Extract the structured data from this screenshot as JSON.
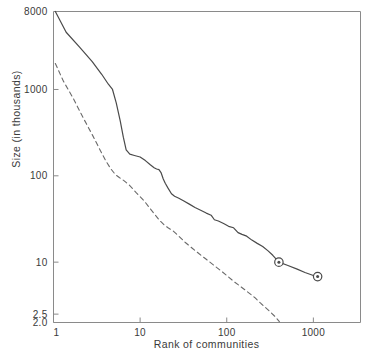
{
  "chart_data": {
    "type": "line",
    "title": "",
    "xlabel": "Rank of communities",
    "ylabel": "Size (in thousands)",
    "xscale": "log",
    "yscale": "log",
    "xlim": [
      1,
      3500
    ],
    "ylim": [
      2.0,
      8000
    ],
    "grid": false,
    "legend": "none",
    "xticks": [
      {
        "value": 1,
        "label": "1"
      },
      {
        "value": 10,
        "label": "10"
      },
      {
        "value": 100,
        "label": "100"
      },
      {
        "value": 1000,
        "label": "1000"
      }
    ],
    "yticks": [
      {
        "value": 8000,
        "label": "8000"
      },
      {
        "value": 1000,
        "label": "1000"
      },
      {
        "value": 100,
        "label": "100"
      },
      {
        "value": 10,
        "label": "10"
      },
      {
        "value": 2.5,
        "label": "2.5"
      },
      {
        "value": 2.0,
        "label": "2.0"
      }
    ],
    "series": [
      {
        "name": "upper-solid-curve",
        "style": "solid",
        "color": "#4a4a4a",
        "points": [
          [
            1.05,
            8000
          ],
          [
            1.4,
            4600
          ],
          [
            2.0,
            3100
          ],
          [
            2.8,
            2100
          ],
          [
            3.6,
            1500
          ],
          [
            4.3,
            1150
          ],
          [
            4.8,
            1000
          ],
          [
            5.3,
            700
          ],
          [
            5.9,
            430
          ],
          [
            6.4,
            280
          ],
          [
            6.9,
            200
          ],
          [
            7.6,
            178
          ],
          [
            8.6,
            172
          ],
          [
            10.0,
            165
          ],
          [
            11.5,
            150
          ],
          [
            13.0,
            135
          ],
          [
            14.5,
            124
          ],
          [
            15.5,
            120
          ],
          [
            16.5,
            118
          ],
          [
            17.5,
            108
          ],
          [
            18.5,
            92
          ],
          [
            19.5,
            82
          ],
          [
            21.0,
            72
          ],
          [
            23.0,
            62
          ],
          [
            25.0,
            58
          ],
          [
            28.0,
            55
          ],
          [
            32.0,
            51
          ],
          [
            37.0,
            47
          ],
          [
            43.0,
            43
          ],
          [
            50.0,
            40
          ],
          [
            58.0,
            37
          ],
          [
            66.0,
            35
          ],
          [
            72.0,
            31
          ],
          [
            80.0,
            30
          ],
          [
            92.0,
            28
          ],
          [
            105.0,
            26
          ],
          [
            120.0,
            25
          ],
          [
            135.0,
            22
          ],
          [
            150.0,
            21
          ],
          [
            170.0,
            20
          ],
          [
            195.0,
            18
          ],
          [
            225.0,
            16.5
          ],
          [
            260.0,
            15.2
          ],
          [
            300.0,
            13.5
          ],
          [
            340.0,
            12.0
          ],
          [
            400.0,
            10.0
          ],
          [
            500.0,
            9.2
          ],
          [
            650.0,
            8.3
          ],
          [
            800.0,
            7.6
          ],
          [
            1000.0,
            7.0
          ],
          [
            1120.0,
            6.8
          ]
        ],
        "markers": [
          {
            "x": 400,
            "y": 10.0,
            "shape": "circle-dot"
          },
          {
            "x": 1120,
            "y": 6.8,
            "shape": "circle-dot"
          }
        ]
      },
      {
        "name": "lower-dashed-curve",
        "style": "dashed",
        "color": "#6a6a6a",
        "points": [
          [
            1.05,
            2000
          ],
          [
            1.3,
            1250
          ],
          [
            1.7,
            780
          ],
          [
            2.2,
            470
          ],
          [
            2.8,
            300
          ],
          [
            3.4,
            205
          ],
          [
            4.0,
            150
          ],
          [
            4.6,
            120
          ],
          [
            5.2,
            103
          ],
          [
            5.8,
            95
          ],
          [
            6.5,
            88
          ],
          [
            7.5,
            78
          ],
          [
            9.0,
            64
          ],
          [
            11.0,
            52
          ],
          [
            13.0,
            42
          ],
          [
            15.0,
            35
          ],
          [
            17.0,
            30
          ],
          [
            19.0,
            27
          ],
          [
            21.0,
            25
          ],
          [
            24.0,
            23
          ],
          [
            28.0,
            20
          ],
          [
            33.0,
            17
          ],
          [
            40.0,
            14.5
          ],
          [
            48.0,
            12.5
          ],
          [
            58.0,
            10.8
          ],
          [
            70.0,
            9.3
          ],
          [
            85.0,
            8.0
          ],
          [
            100.0,
            7.0
          ],
          [
            120.0,
            6.0
          ],
          [
            145.0,
            5.2
          ],
          [
            175.0,
            4.5
          ],
          [
            210.0,
            3.9
          ],
          [
            250.0,
            3.3
          ],
          [
            300.0,
            2.8
          ],
          [
            360.0,
            2.35
          ],
          [
            405.0,
            2.05
          ]
        ],
        "markers": []
      }
    ]
  },
  "axes": {
    "xlabel": "Rank of communities",
    "ylabel": "Size (in thousands)"
  },
  "colors": {
    "frame": "#8a8a8a",
    "solid_line": "#4a4a4a",
    "dashed_line": "#6a6a6a",
    "text": "#3a3a3a",
    "background": "#ffffff"
  }
}
